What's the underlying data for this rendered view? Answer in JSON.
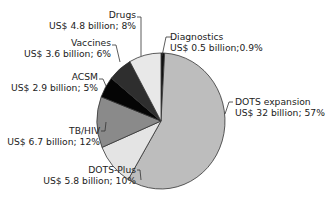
{
  "chart_data": {
    "type": "pie",
    "title": "",
    "start_angle_deg": 0,
    "direction": "clockwise",
    "slices": [
      {
        "name": "Diagnostics",
        "value_label": "US$ 0.5 billion;0.9%",
        "value_billion": 0.5,
        "percent": 0.9,
        "color": "#111111"
      },
      {
        "name": "DOTS expansion",
        "value_label": "US$ 32 billion; 57%",
        "value_billion": 32,
        "percent": 57,
        "color": "#bdbdbd"
      },
      {
        "name": "DOTS-Plus",
        "value_label": "US$ 5.8 billion; 10%",
        "value_billion": 5.8,
        "percent": 10,
        "color": "#e4e4e4"
      },
      {
        "name": "TB/HIV",
        "value_label": "US$ 6.7 billion; 12%",
        "value_billion": 6.7,
        "percent": 12,
        "color": "#8a8a8a"
      },
      {
        "name": "ACSM",
        "value_label": "US$ 2.9 billion; 5%",
        "value_billion": 2.9,
        "percent": 5,
        "color": "#050505"
      },
      {
        "name": "Vaccines",
        "value_label": "US$ 3.6 billion; 6%",
        "value_billion": 3.6,
        "percent": 6,
        "color": "#2e2e2e"
      },
      {
        "name": "Drugs",
        "value_label": "US$ 4.8 billion; 8%",
        "value_billion": 4.8,
        "percent": 8,
        "color": "#e8e8e8"
      }
    ],
    "legend": "none (direct labels)"
  },
  "labels": {
    "drugs": {
      "name": "Drugs",
      "value": "US$ 4.8 billion; 8%"
    },
    "vaccines": {
      "name": "Vaccines",
      "value": "US$ 3.6 billion; 6%"
    },
    "acsm": {
      "name": "ACSM",
      "value": "US$ 2.9 billion; 5%"
    },
    "tbhiv": {
      "name": "TB/HIV",
      "value": "US$ 6.7 billion; 12%"
    },
    "dotsplus": {
      "name": "DOTS-Plus",
      "value": "US$ 5.8 billion; 10%"
    },
    "diagnostics": {
      "name": "Diagnostics",
      "value": "US$ 0.5 billion;0.9%"
    },
    "dotsexp": {
      "name": "DOTS expansion",
      "value": "US$ 32 billion; 57%"
    }
  }
}
